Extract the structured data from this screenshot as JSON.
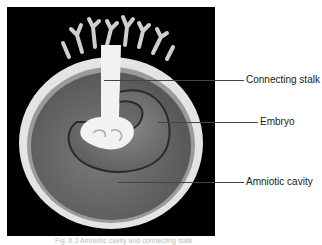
{
  "figure": {
    "background_color": "#000000",
    "colors": {
      "membrane": "#e6e6e6",
      "amniotic_cavity": "#6e6e6e",
      "embryo": "#7a7a7a",
      "stalk": "#f0f0f0"
    }
  },
  "labels": [
    {
      "id": "connecting-stalk",
      "text": "Connecting stalk"
    },
    {
      "id": "embryo",
      "text": "Embryo"
    },
    {
      "id": "amniotic-cavity",
      "text": "Amniotic cavity"
    }
  ],
  "caption": "Fig. 6.3  Amniotic cavity and connecting stalk"
}
